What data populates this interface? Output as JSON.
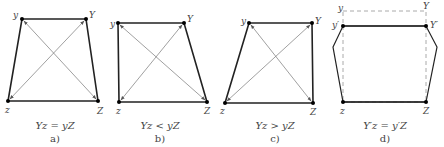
{
  "colors": {
    "edge": "#222222",
    "diagonal": "#666666",
    "dashed": "#aaaaaa",
    "text": "#444444"
  },
  "panels": [
    {
      "id": "a",
      "caption": "a)",
      "equation": "Yz = yZ",
      "vertices": {
        "y": {
          "label": "y",
          "x": 22,
          "y": 19
        },
        "Y": {
          "label": "Y",
          "x": 86,
          "y": 19
        },
        "z": {
          "label": "z",
          "x": 8,
          "y": 101
        },
        "Z": {
          "label": "Z",
          "x": 98,
          "y": 101
        }
      }
    },
    {
      "id": "b",
      "caption": "b)",
      "equation": "Yz < yZ",
      "vertices": {
        "y": {
          "label": "y",
          "x": 118,
          "y": 23
        },
        "Y": {
          "label": "Y",
          "x": 184,
          "y": 23
        },
        "z": {
          "label": "z",
          "x": 119,
          "y": 102
        },
        "Z": {
          "label": "Z",
          "x": 207,
          "y": 102
        }
      }
    },
    {
      "id": "c",
      "caption": "c)",
      "equation": "Yz > yZ",
      "vertices": {
        "y": {
          "label": "y",
          "x": 249,
          "y": 23
        },
        "Y": {
          "label": "Y",
          "x": 312,
          "y": 23
        },
        "z": {
          "label": "z",
          "x": 225,
          "y": 103
        },
        "Z": {
          "label": "Z",
          "x": 313,
          "y": 103
        }
      }
    },
    {
      "id": "d",
      "caption": "d)",
      "equation": "Y′z = y′Z",
      "vertices": {
        "y": {
          "label": "y",
          "x": 343,
          "y": 11
        },
        "Y": {
          "label": "Y",
          "x": 426,
          "y": 11
        },
        "y_prime": {
          "label": "y′",
          "x": 343,
          "y": 26
        },
        "Y_prime": {
          "label": "Y′",
          "x": 426,
          "y": 26
        },
        "z": {
          "label": "z",
          "x": 343,
          "y": 102
        },
        "Z": {
          "label": "Z",
          "x": 426,
          "y": 102
        }
      }
    }
  ]
}
